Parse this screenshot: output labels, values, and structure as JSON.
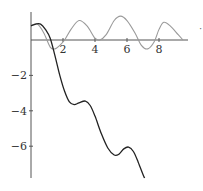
{
  "chart_data": {
    "type": "line",
    "title": "",
    "xlabel": "",
    "ylabel": "",
    "xlim": [
      0,
      9.6
    ],
    "ylim": [
      -7.8,
      1.5
    ],
    "grid": false,
    "legend": null,
    "x_ticks": [
      "2",
      "4",
      "6",
      "8"
    ],
    "y_ticks": [
      "-2",
      "-4",
      "-6"
    ],
    "series": [
      {
        "name": "oscillating curve (gray)",
        "color": "#9a9a9a",
        "points": [
          [
            0.0,
            0.8
          ],
          [
            0.4,
            0.9
          ],
          [
            0.8,
            0.4
          ],
          [
            1.2,
            -0.4
          ],
          [
            1.5,
            -0.5
          ],
          [
            1.8,
            -0.3
          ],
          [
            2.1,
            0.0
          ],
          [
            2.5,
            0.6
          ],
          [
            3.0,
            1.1
          ],
          [
            3.5,
            0.8
          ],
          [
            4.0,
            0.1
          ],
          [
            4.3,
            0.0
          ],
          [
            4.7,
            0.3
          ],
          [
            5.2,
            1.1
          ],
          [
            5.6,
            1.35
          ],
          [
            6.0,
            1.1
          ],
          [
            6.5,
            0.4
          ],
          [
            6.9,
            -0.3
          ],
          [
            7.3,
            -0.5
          ],
          [
            7.7,
            -0.1
          ],
          [
            8.0,
            0.6
          ],
          [
            8.3,
            1.0
          ],
          [
            8.7,
            0.8
          ],
          [
            9.2,
            0.3
          ],
          [
            9.5,
            0.0
          ]
        ]
      },
      {
        "name": "decreasing curve (black)",
        "color": "#222222",
        "points": [
          [
            0.0,
            0.8
          ],
          [
            0.3,
            0.9
          ],
          [
            0.6,
            0.9
          ],
          [
            0.9,
            0.6
          ],
          [
            1.2,
            0.1
          ],
          [
            1.5,
            -0.9
          ],
          [
            1.8,
            -2.0
          ],
          [
            2.1,
            -2.9
          ],
          [
            2.4,
            -3.5
          ],
          [
            2.7,
            -3.65
          ],
          [
            3.0,
            -3.55
          ],
          [
            3.4,
            -3.45
          ],
          [
            3.7,
            -3.7
          ],
          [
            4.0,
            -4.3
          ],
          [
            4.4,
            -5.3
          ],
          [
            4.8,
            -6.1
          ],
          [
            5.2,
            -6.5
          ],
          [
            5.5,
            -6.45
          ],
          [
            5.8,
            -6.15
          ],
          [
            6.1,
            -6.05
          ],
          [
            6.4,
            -6.3
          ],
          [
            6.7,
            -6.9
          ],
          [
            7.0,
            -7.6
          ],
          [
            7.1,
            -7.8
          ]
        ]
      }
    ]
  },
  "annotations": {
    "stray_mark": "·"
  }
}
